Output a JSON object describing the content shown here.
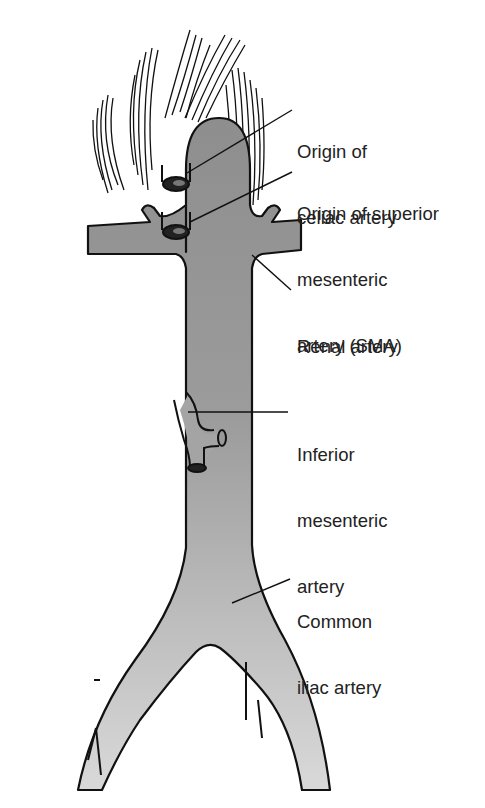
{
  "diagram": {
    "colors": {
      "vessel_top": "#8e8e8e",
      "vessel_bottom": "#d8d8d8",
      "outline": "#111111",
      "label_text": "#222222"
    },
    "labels": [
      {
        "id": "celiac",
        "lines": [
          "Origin of",
          "celiac artery"
        ]
      },
      {
        "id": "sma",
        "lines": [
          "Origin of superior",
          "mesenteric",
          "artery (SMA)"
        ]
      },
      {
        "id": "renal",
        "lines": [
          "Renal artery"
        ]
      },
      {
        "id": "ima",
        "lines": [
          "Inferior",
          "mesenteric",
          "artery"
        ]
      },
      {
        "id": "iliac",
        "lines": [
          "Common",
          "iliac artery"
        ]
      }
    ]
  }
}
